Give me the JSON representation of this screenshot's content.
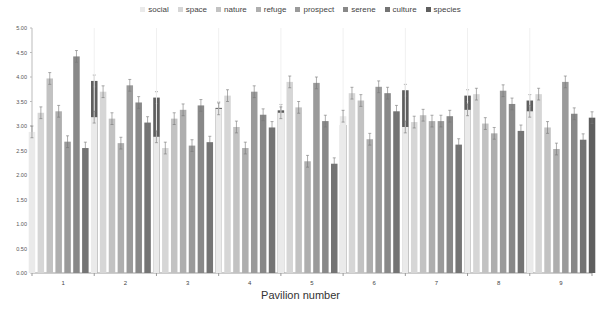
{
  "chart_data": {
    "type": "bar",
    "title": "",
    "xlabel": "Pavilion number",
    "ylabel": "",
    "ylim": [
      0,
      5
    ],
    "yticks": [
      "0.00",
      "0.50",
      "1.00",
      "1.50",
      "2.00",
      "2.50",
      "3.00",
      "3.50",
      "4.00",
      "4.50",
      "5.00"
    ],
    "grid": false,
    "legend_position": "top",
    "error_bars": true,
    "categories": [
      "1",
      "2",
      "3",
      "4",
      "5",
      "6",
      "7",
      "8",
      "9"
    ],
    "series": [
      {
        "name": "social",
        "color": "#eaeaea",
        "values": [
          2.88,
          3.18,
          2.78,
          3.35,
          3.27,
          3.2,
          2.98,
          3.33,
          3.3
        ]
      },
      {
        "name": "space",
        "color": "#d6d6d6",
        "values": [
          3.27,
          3.7,
          2.55,
          3.62,
          3.9,
          3.67,
          3.08,
          3.65,
          3.65
        ]
      },
      {
        "name": "nature",
        "color": "#c2c2c2",
        "values": [
          3.97,
          3.15,
          3.15,
          2.98,
          3.38,
          3.52,
          3.22,
          3.05,
          2.97
        ]
      },
      {
        "name": "refuge",
        "color": "#aeaeae",
        "values": [
          3.3,
          2.65,
          3.33,
          2.55,
          2.28,
          2.73,
          3.1,
          2.85,
          2.53
        ]
      },
      {
        "name": "prospect",
        "color": "#9a9a9a",
        "values": [
          2.68,
          3.83,
          2.6,
          3.7,
          3.88,
          3.8,
          3.1,
          3.72,
          3.9
        ]
      },
      {
        "name": "serene",
        "color": "#888888",
        "values": [
          4.42,
          3.48,
          3.42,
          3.23,
          3.1,
          3.67,
          3.2,
          3.45,
          3.25
        ]
      },
      {
        "name": "culture",
        "color": "#747474",
        "values": [
          2.55,
          3.07,
          2.67,
          2.97,
          2.23,
          3.3,
          2.62,
          2.9,
          2.72
        ]
      },
      {
        "name": "species",
        "color": "#5e5e5e",
        "values": [
          3.92,
          3.58,
          3.37,
          3.32,
          3.02,
          3.73,
          3.62,
          3.52,
          3.17
        ]
      }
    ],
    "error": 0.12
  }
}
